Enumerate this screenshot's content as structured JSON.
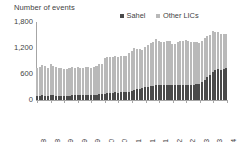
{
  "chart_data": {
    "type": "bar",
    "title": "Number of events",
    "subtitle": "",
    "xlabel": "",
    "ylabel": "Number of events",
    "ylim": [
      0,
      1800
    ],
    "yticks": [
      "0",
      "600",
      "1,200",
      "1,800"
    ],
    "ytick_values": [
      0,
      600,
      1200,
      1800
    ],
    "grid": false,
    "stacked": true,
    "legend_position": "top-right",
    "legend": [
      "Sahel",
      "Other LICs"
    ],
    "colors": {
      "Sahel": "#4a4a4a",
      "Other LICs": "#b9b9b9",
      "axis": "#a6a6a6",
      "text": "#3f3f3f",
      "background": "#ffffff"
    },
    "categories": [
      "Mar-18",
      "Apr-18",
      "May-18",
      "Jun-18",
      "Jul-18",
      "Aug-18",
      "Sep-18",
      "Oct-18",
      "Nov-18",
      "Dec-18",
      "Jan-19",
      "Feb-19",
      "Mar-19",
      "Apr-19",
      "May-19",
      "Jun-19",
      "Jul-19",
      "Aug-19",
      "Sep-19",
      "Oct-19",
      "Nov-19",
      "Dec-19",
      "Jan-20",
      "Feb-20",
      "Mar-20",
      "Apr-20",
      "May-20",
      "Jun-20",
      "Jul-20",
      "Aug-20",
      "Sep-20",
      "Oct-20",
      "Nov-20",
      "Dec-20",
      "Jan-21",
      "Feb-21",
      "Mar-21",
      "Apr-21",
      "May-21",
      "Jun-21",
      "Jul-21",
      "Aug-21",
      "Sep-21",
      "Oct-21",
      "Nov-21",
      "Dec-21",
      "Jan-22",
      "Feb-22",
      "Mar-22",
      "Apr-22",
      "May-22",
      "Jun-22",
      "Jul-22",
      "Aug-22",
      "Sep-22",
      "Oct-22",
      "Nov-22",
      "Dec-22",
      "Jan-23",
      "Feb-23",
      "Mar-23",
      "Apr-23",
      "May-23",
      "Jun-23",
      "Jul-23",
      "Aug-23",
      "Sep-23",
      "Oct-23",
      "Nov-23",
      "Dec-23",
      "Jan-24"
    ],
    "xtick_labels": [
      "Mar-18",
      "Aug-18",
      "Jan-19",
      "Jun-19",
      "Nov-19",
      "Apr-20",
      "Sep-20",
      "Feb-21",
      "Jul-21",
      "Dec-21",
      "May-22",
      "Oct-22",
      "Mar-23",
      "Aug-23",
      "Jan-24"
    ],
    "xtick_indices": [
      0,
      5,
      10,
      15,
      20,
      25,
      30,
      35,
      40,
      45,
      50,
      55,
      60,
      65,
      70
    ],
    "series": [
      {
        "name": "Sahel",
        "values": [
          95,
          100,
          105,
          100,
          95,
          110,
          105,
          100,
          95,
          100,
          95,
          95,
          100,
          105,
          110,
          115,
          110,
          115,
          120,
          115,
          110,
          120,
          125,
          135,
          140,
          150,
          160,
          165,
          170,
          175,
          170,
          180,
          185,
          190,
          195,
          210,
          230,
          250,
          260,
          270,
          290,
          300,
          320,
          330,
          345,
          355,
          350,
          345,
          355,
          350,
          340,
          345,
          350,
          345,
          350,
          355,
          350,
          345,
          350,
          360,
          380,
          420,
          470,
          530,
          580,
          640,
          690,
          720,
          700,
          720,
          740
        ]
      },
      {
        "name": "Other LICs",
        "values": [
          645,
          660,
          700,
          680,
          650,
          730,
          690,
          665,
          640,
          650,
          610,
          615,
          640,
          650,
          640,
          640,
          625,
          620,
          650,
          640,
          625,
          650,
          665,
          690,
          700,
          820,
          840,
          835,
          820,
          850,
          830,
          840,
          820,
          830,
          900,
          930,
          960,
          930,
          910,
          890,
          930,
          960,
          1000,
          1010,
          1060,
          1000,
          980,
          990,
          1000,
          1010,
          960,
          950,
          980,
          1010,
          1020,
          1040,
          1010,
          1000,
          990,
          980,
          940,
          950,
          960,
          950,
          930,
          960,
          870,
          840,
          820,
          810,
          790
        ]
      },
      {
        "name": "Total",
        "values": [
          740,
          760,
          805,
          780,
          745,
          840,
          795,
          765,
          735,
          750,
          705,
          710,
          740,
          755,
          750,
          755,
          735,
          735,
          770,
          755,
          735,
          770,
          790,
          825,
          840,
          970,
          1000,
          1000,
          990,
          1025,
          1000,
          1020,
          1005,
          1020,
          1095,
          1140,
          1190,
          1180,
          1170,
          1160,
          1220,
          1260,
          1320,
          1340,
          1405,
          1355,
          1330,
          1335,
          1355,
          1360,
          1300,
          1295,
          1330,
          1355,
          1370,
          1395,
          1360,
          1345,
          1340,
          1340,
          1320,
          1370,
          1430,
          1480,
          1510,
          1600,
          1560,
          1560,
          1520,
          1530,
          1530
        ]
      }
    ]
  }
}
